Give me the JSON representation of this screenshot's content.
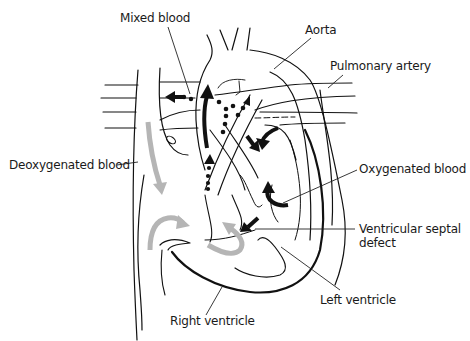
{
  "diagram": {
    "type": "anatomical-heart-diagram",
    "labels": [
      {
        "id": "mixed-blood",
        "text": "Mixed blood",
        "x": 120,
        "y": 11
      },
      {
        "id": "aorta",
        "text": "Aorta",
        "x": 305,
        "y": 23
      },
      {
        "id": "pulmonary-artery",
        "text": "Pulmonary artery",
        "x": 330,
        "y": 59
      },
      {
        "id": "deoxygenated-blood",
        "text": "Deoxygenated blood",
        "x": 9,
        "y": 158
      },
      {
        "id": "oxygenated-blood",
        "text": "Oxygenated blood",
        "x": 359,
        "y": 162
      },
      {
        "id": "ventricular-septal-defect-line1",
        "text": "Ventricular septal",
        "x": 359,
        "y": 222
      },
      {
        "id": "ventricular-septal-defect-line2",
        "text": "defect",
        "x": 359,
        "y": 236
      },
      {
        "id": "left-ventricle",
        "text": "Left ventricle",
        "x": 320,
        "y": 293
      },
      {
        "id": "right-ventricle",
        "text": "Right ventricle",
        "x": 170,
        "y": 314
      }
    ],
    "legend_markers": {
      "gray_arrows": "deoxygenated blood flow",
      "black_arrows": "oxygenated blood flow",
      "dotted_arrows": "mixed blood flow"
    },
    "colors": {
      "line": "#111111",
      "gray_arrow": "#b5b5b5",
      "background": "#ffffff"
    }
  }
}
